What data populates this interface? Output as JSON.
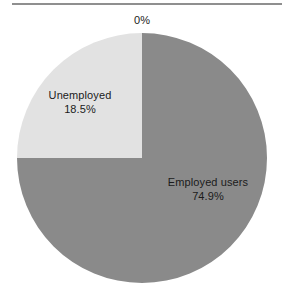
{
  "figure": {
    "background_color": "#ffffff",
    "rule_color": "#8f8f8f"
  },
  "chart_data": {
    "type": "pie",
    "title": "",
    "subtitle": "",
    "xlabel": "",
    "ylabel": "",
    "legend_position": "none",
    "grid": false,
    "labels_inside": true,
    "start_angle_deg": 0,
    "direction": "clockwise",
    "categories": [
      "Employed users",
      "Unemployed",
      "0%"
    ],
    "values": [
      74.9,
      18.5,
      0
    ],
    "value_labels": [
      "74.9%",
      "18.5%",
      "0%"
    ],
    "colors": [
      "#8a8a8a",
      "#e2e2e2",
      "#8a8a8a"
    ],
    "slices": [
      {
        "name": "Employed users",
        "value": 74.9,
        "value_label": "74.9%",
        "color": "#8a8a8a",
        "start_angle_deg": 0,
        "end_angle_deg": 270,
        "sweep_deg": 270
      },
      {
        "name": "Unemployed",
        "value": 18.5,
        "value_label": "18.5%",
        "color": "#e2e2e2",
        "start_angle_deg": 270,
        "end_angle_deg": 360,
        "sweep_deg": 90
      },
      {
        "name": "",
        "value": 0,
        "value_label": "0%",
        "color": "#8a8a8a",
        "start_angle_deg": 0,
        "end_angle_deg": 0,
        "sweep_deg": 0
      }
    ]
  },
  "annotations": {
    "zero_label": "0%",
    "unemployed_name": "Unemployed",
    "unemployed_pct": "18.5%",
    "employed_name": "Employed users",
    "employed_pct": "74.9%"
  }
}
